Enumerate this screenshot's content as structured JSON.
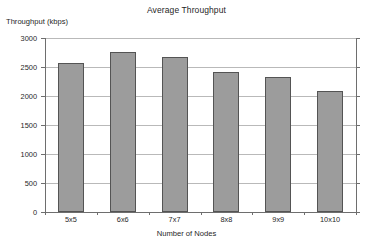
{
  "chart_data": {
    "type": "bar",
    "title": "Average Throughput",
    "xlabel": "Number of Nodes",
    "ylabel": "Throughput (kbps)",
    "categories": [
      "5x5",
      "6x6",
      "7x7",
      "8x8",
      "9x9",
      "10x10"
    ],
    "values": [
      2570,
      2760,
      2670,
      2420,
      2335,
      2085
    ],
    "ylim": [
      0,
      3000
    ],
    "yticks": [
      0,
      500,
      1000,
      1500,
      2000,
      2500,
      3000
    ],
    "ytick_labels": [
      "0",
      "500",
      "1000",
      "1500",
      "2000",
      "2500",
      "3000"
    ],
    "grid": true,
    "legend": "none",
    "series": [
      {
        "name": "Average Throughput",
        "values": [
          2570,
          2760,
          2670,
          2420,
          2335,
          2085
        ]
      }
    ],
    "colors": {
      "bar_fill": "#9c9c9c",
      "bar_border": "#545454",
      "gridline": "#b9b9b9",
      "axis": "#6e6e6e",
      "text": "#1f1f1f",
      "background": "#ffffff"
    }
  }
}
